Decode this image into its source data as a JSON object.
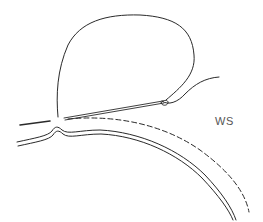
{
  "figure": {
    "type": "line-illustration",
    "label": "WS",
    "colors": {
      "stroke": "#2a2a2a",
      "label": "#555555",
      "background": "#ffffff"
    },
    "elements": [
      "suture-loop",
      "needle",
      "tissue-wall-double-line",
      "dashed-contour",
      "left-stub"
    ]
  }
}
